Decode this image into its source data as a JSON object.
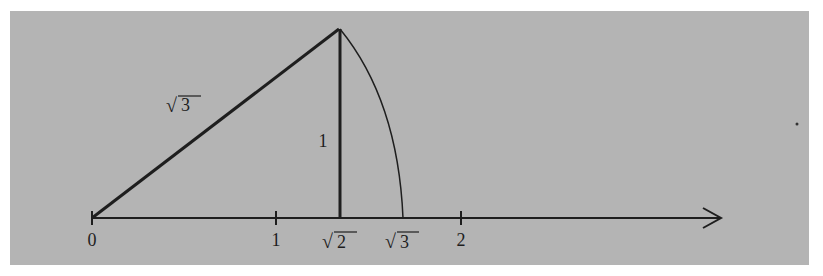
{
  "figure": {
    "background_color": "#b4b4b4",
    "ink_color": "#1e1e1e",
    "number_line": {
      "ticks": [
        {
          "value": "0",
          "label": "0",
          "x": 92
        },
        {
          "value": "1",
          "label": "1",
          "x": 276
        },
        {
          "value": "sqrt2",
          "label_radical": "√",
          "label_radicand": "2",
          "x": 340
        },
        {
          "value": "sqrt3",
          "label_radical": "√",
          "label_radicand": "3",
          "x": 403
        },
        {
          "value": "2",
          "label": "2",
          "x": 461
        }
      ],
      "arrow": "right-arrow"
    },
    "triangle": {
      "hypotenuse_label_radical": "√",
      "hypotenuse_label_radicand": "3",
      "vertical_leg_label": "1"
    },
    "arc": "arc from triangle apex to √3 on axis, centered at 0"
  }
}
